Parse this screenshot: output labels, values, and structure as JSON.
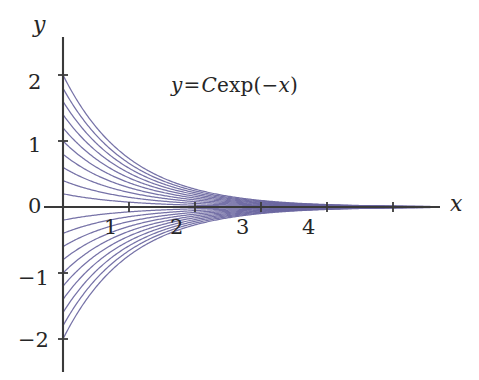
{
  "figure": {
    "background_color": "#ffffff",
    "axis_color": "#3a3a3a",
    "curve_color": "#6a66a0",
    "curve_color_dense": "#5b4f9c",
    "text_color": "#262626"
  },
  "equation": {
    "lhs": "y",
    "relation": "=",
    "constant": "C",
    "function": "exp(",
    "argument": "−x",
    "close": ")",
    "full_text": "y = C exp(−x)"
  },
  "axes": {
    "x_axis_label": "x",
    "y_axis_label": "y",
    "x_ticks": [
      "1",
      "2",
      "3",
      "4"
    ],
    "y_ticks": [
      "2",
      "1",
      "0",
      "−1",
      "−2"
    ]
  },
  "chart_data": {
    "type": "line",
    "title": "",
    "subtitle": "",
    "xlabel": "x",
    "ylabel": "y",
    "xlim": [
      -0.22,
      5.7
    ],
    "ylim": [
      -2.45,
      2.45
    ],
    "x_ticks": [
      1,
      2,
      3,
      4
    ],
    "x_tick_labels": [
      "1",
      "2",
      "3",
      "4"
    ],
    "x_ticks_unlabeled": [
      5
    ],
    "y_ticks": [
      2,
      1,
      0,
      -1,
      -2
    ],
    "y_tick_labels": [
      "2",
      "1",
      "0",
      "−1",
      "−2"
    ],
    "grid": false,
    "legend": false,
    "legend_position": "none",
    "annotations": [
      {
        "text": "y = C exp(−x)",
        "x": 1.65,
        "y": 1.72
      }
    ],
    "function": "y = C*exp(-x)",
    "series_description": "Family of exponential decay curves for 21 values of the constant C evenly spaced from -2 to 2; each curve starts at (0, C) on the y-axis and decays toward y = 0 as x increases.",
    "series": [
      {
        "name": "C = 2.0",
        "C": 2.0,
        "x": [
          0,
          0.5,
          1,
          1.5,
          2,
          2.5,
          3,
          3.5,
          4,
          4.5,
          5,
          5.5
        ],
        "values": [
          2.0,
          1.213,
          0.736,
          0.446,
          0.271,
          0.164,
          0.1,
          0.06,
          0.037,
          0.022,
          0.013,
          0.008
        ]
      },
      {
        "name": "C = 1.8",
        "C": 1.8,
        "x": [
          0,
          0.5,
          1,
          1.5,
          2,
          2.5,
          3,
          3.5,
          4,
          4.5,
          5,
          5.5
        ],
        "values": [
          1.8,
          1.092,
          0.662,
          0.402,
          0.244,
          0.148,
          0.09,
          0.054,
          0.033,
          0.02,
          0.012,
          0.007
        ]
      },
      {
        "name": "C = 1.6",
        "C": 1.6,
        "x": [
          0,
          0.5,
          1,
          1.5,
          2,
          2.5,
          3,
          3.5,
          4,
          4.5,
          5,
          5.5
        ],
        "values": [
          1.6,
          0.971,
          0.589,
          0.357,
          0.217,
          0.131,
          0.08,
          0.048,
          0.029,
          0.018,
          0.011,
          0.007
        ]
      },
      {
        "name": "C = 1.4",
        "C": 1.4,
        "x": [
          0,
          0.5,
          1,
          1.5,
          2,
          2.5,
          3,
          3.5,
          4,
          4.5,
          5,
          5.5
        ],
        "values": [
          1.4,
          0.849,
          0.515,
          0.312,
          0.19,
          0.115,
          0.07,
          0.042,
          0.026,
          0.016,
          0.009,
          0.006
        ]
      },
      {
        "name": "C = 1.2",
        "C": 1.2,
        "x": [
          0,
          0.5,
          1,
          1.5,
          2,
          2.5,
          3,
          3.5,
          4,
          4.5,
          5,
          5.5
        ],
        "values": [
          1.2,
          0.728,
          0.441,
          0.268,
          0.162,
          0.098,
          0.06,
          0.036,
          0.022,
          0.013,
          0.008,
          0.005
        ]
      },
      {
        "name": "C = 1.0",
        "C": 1.0,
        "x": [
          0,
          0.5,
          1,
          1.5,
          2,
          2.5,
          3,
          3.5,
          4,
          4.5,
          5,
          5.5
        ],
        "values": [
          1.0,
          0.607,
          0.368,
          0.223,
          0.135,
          0.082,
          0.05,
          0.03,
          0.018,
          0.011,
          0.007,
          0.004
        ]
      },
      {
        "name": "C = 0.8",
        "C": 0.8,
        "x": [
          0,
          0.5,
          1,
          1.5,
          2,
          2.5,
          3,
          3.5,
          4,
          4.5,
          5,
          5.5
        ],
        "values": [
          0.8,
          0.485,
          0.294,
          0.179,
          0.108,
          0.066,
          0.04,
          0.024,
          0.015,
          0.009,
          0.005,
          0.003
        ]
      },
      {
        "name": "C = 0.6",
        "C": 0.6,
        "x": [
          0,
          0.5,
          1,
          1.5,
          2,
          2.5,
          3,
          3.5,
          4,
          4.5,
          5,
          5.5
        ],
        "values": [
          0.6,
          0.364,
          0.221,
          0.134,
          0.081,
          0.049,
          0.03,
          0.018,
          0.011,
          0.007,
          0.004,
          0.002
        ]
      },
      {
        "name": "C = 0.4",
        "C": 0.4,
        "x": [
          0,
          0.5,
          1,
          1.5,
          2,
          2.5,
          3,
          3.5,
          4,
          4.5,
          5,
          5.5
        ],
        "values": [
          0.4,
          0.243,
          0.147,
          0.089,
          0.054,
          0.033,
          0.02,
          0.012,
          0.007,
          0.004,
          0.003,
          0.002
        ]
      },
      {
        "name": "C = 0.2",
        "C": 0.2,
        "x": [
          0,
          0.5,
          1,
          1.5,
          2,
          2.5,
          3,
          3.5,
          4,
          4.5,
          5,
          5.5
        ],
        "values": [
          0.2,
          0.121,
          0.074,
          0.045,
          0.027,
          0.016,
          0.01,
          0.006,
          0.004,
          0.002,
          0.001,
          0.001
        ]
      },
      {
        "name": "C = 0.0",
        "C": 0.0,
        "x": [
          0,
          0.5,
          1,
          1.5,
          2,
          2.5,
          3,
          3.5,
          4,
          4.5,
          5,
          5.5
        ],
        "values": [
          0,
          0,
          0,
          0,
          0,
          0,
          0,
          0,
          0,
          0,
          0,
          0
        ]
      },
      {
        "name": "C = -0.2",
        "C": -0.2,
        "x": [
          0,
          0.5,
          1,
          1.5,
          2,
          2.5,
          3,
          3.5,
          4,
          4.5,
          5,
          5.5
        ],
        "values": [
          -0.2,
          -0.121,
          -0.074,
          -0.045,
          -0.027,
          -0.016,
          -0.01,
          -0.006,
          -0.004,
          -0.002,
          -0.001,
          -0.001
        ]
      },
      {
        "name": "C = -0.4",
        "C": -0.4,
        "x": [
          0,
          0.5,
          1,
          1.5,
          2,
          2.5,
          3,
          3.5,
          4,
          4.5,
          5,
          5.5
        ],
        "values": [
          -0.4,
          -0.243,
          -0.147,
          -0.089,
          -0.054,
          -0.033,
          -0.02,
          -0.012,
          -0.007,
          -0.004,
          -0.003,
          -0.002
        ]
      },
      {
        "name": "C = -0.6",
        "C": -0.6,
        "x": [
          0,
          0.5,
          1,
          1.5,
          2,
          2.5,
          3,
          3.5,
          4,
          4.5,
          5,
          5.5
        ],
        "values": [
          -0.6,
          -0.364,
          -0.221,
          -0.134,
          -0.081,
          -0.049,
          -0.03,
          -0.018,
          -0.011,
          -0.007,
          -0.004,
          -0.002
        ]
      },
      {
        "name": "C = -0.8",
        "C": -0.8,
        "x": [
          0,
          0.5,
          1,
          1.5,
          2,
          2.5,
          3,
          3.5,
          4,
          4.5,
          5,
          5.5
        ],
        "values": [
          -0.8,
          -0.485,
          -0.294,
          -0.179,
          -0.108,
          -0.066,
          -0.04,
          -0.024,
          -0.015,
          -0.009,
          -0.005,
          -0.003
        ]
      },
      {
        "name": "C = -1.0",
        "C": -1.0,
        "x": [
          0,
          0.5,
          1,
          1.5,
          2,
          2.5,
          3,
          3.5,
          4,
          4.5,
          5,
          5.5
        ],
        "values": [
          -1.0,
          -0.607,
          -0.368,
          -0.223,
          -0.135,
          -0.082,
          -0.05,
          -0.03,
          -0.018,
          -0.011,
          -0.007,
          -0.004
        ]
      },
      {
        "name": "C = -1.2",
        "C": -1.2,
        "x": [
          0,
          0.5,
          1,
          1.5,
          2,
          2.5,
          3,
          3.5,
          4,
          4.5,
          5,
          5.5
        ],
        "values": [
          -1.2,
          -0.728,
          -0.441,
          -0.268,
          -0.162,
          -0.098,
          -0.06,
          -0.036,
          -0.022,
          -0.013,
          -0.008,
          -0.005
        ]
      },
      {
        "name": "C = -1.4",
        "C": -1.4,
        "x": [
          0,
          0.5,
          1,
          1.5,
          2,
          2.5,
          3,
          3.5,
          4,
          4.5,
          5,
          5.5
        ],
        "values": [
          -1.4,
          -0.849,
          -0.515,
          -0.312,
          -0.19,
          -0.115,
          -0.07,
          -0.042,
          -0.026,
          -0.016,
          -0.009,
          -0.006
        ]
      },
      {
        "name": "C = -1.6",
        "C": -1.6,
        "x": [
          0,
          0.5,
          1,
          1.5,
          2,
          2.5,
          3,
          3.5,
          4,
          4.5,
          5,
          5.5
        ],
        "values": [
          -1.6,
          -0.971,
          -0.589,
          -0.357,
          -0.217,
          -0.131,
          -0.08,
          -0.048,
          -0.029,
          -0.018,
          -0.011,
          -0.007
        ]
      },
      {
        "name": "C = -1.8",
        "C": -1.8,
        "x": [
          0,
          0.5,
          1,
          1.5,
          2,
          2.5,
          3,
          3.5,
          4,
          4.5,
          5,
          5.5
        ],
        "values": [
          -1.8,
          -1.092,
          -0.662,
          -0.402,
          -0.244,
          -0.148,
          -0.09,
          -0.054,
          -0.033,
          -0.02,
          -0.012,
          -0.007
        ]
      },
      {
        "name": "C = -2.0",
        "C": -2.0,
        "x": [
          0,
          0.5,
          1,
          1.5,
          2,
          2.5,
          3,
          3.5,
          4,
          4.5,
          5,
          5.5
        ],
        "values": [
          -2.0,
          -1.213,
          -0.736,
          -0.446,
          -0.271,
          -0.164,
          -0.1,
          -0.06,
          -0.037,
          -0.022,
          -0.013,
          -0.008
        ]
      }
    ]
  }
}
